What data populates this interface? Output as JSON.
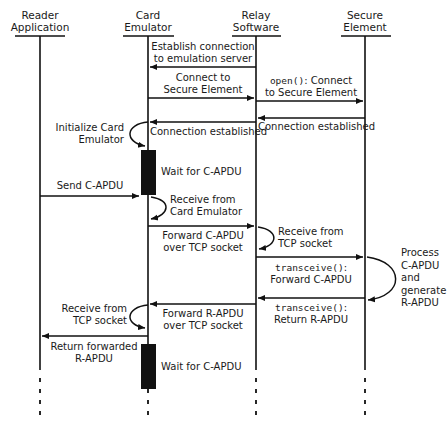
{
  "diagram": {
    "type": "sequence",
    "participants": [
      {
        "id": "reader",
        "line1": "Reader",
        "line2": "Application"
      },
      {
        "id": "card",
        "line1": "Card",
        "line2": "Emulator"
      },
      {
        "id": "relay",
        "line1": "Relay",
        "line2": "Software"
      },
      {
        "id": "secure",
        "line1": "Secure",
        "line2": "Element"
      }
    ],
    "messages": [
      {
        "from": "relay",
        "to": "card",
        "line1": "Establish connection",
        "line2": "to emulation server"
      },
      {
        "from": "card",
        "to": "relay",
        "line1": "Connect to",
        "line2": "Secure Element"
      },
      {
        "from": "relay",
        "to": "secure",
        "code": "open()",
        "line1": ": Connect",
        "line2": "to Secure Element"
      },
      {
        "from": "secure",
        "to": "relay",
        "line1": "Connection established"
      },
      {
        "from": "relay",
        "to": "card",
        "line1": "Connection established"
      },
      {
        "self": "card",
        "line1": "Initialize Card",
        "line2": "Emulator"
      },
      {
        "activation": "card",
        "line1": "Wait for C-APDU"
      },
      {
        "from": "reader",
        "to": "card",
        "line1": "Send C-APDU"
      },
      {
        "self": "card",
        "line1": "Receive from",
        "line2": "Card Emulator"
      },
      {
        "from": "card",
        "to": "relay",
        "line1": "Forward C-APDU",
        "line2": "over TCP socket"
      },
      {
        "self": "relay",
        "line1": "Receive from",
        "line2": "TCP socket"
      },
      {
        "from": "relay",
        "to": "secure",
        "code": "transceive()",
        "line1": ":",
        "line2": "Forward C-APDU"
      },
      {
        "self": "secure",
        "line1": "Process",
        "line2": "C-APDU",
        "line3": "and",
        "line4": "generate",
        "line5": "R-APDU"
      },
      {
        "from": "secure",
        "to": "relay",
        "code": "transceive()",
        "line1": ":",
        "line2": "Return R-APDU"
      },
      {
        "from": "relay",
        "to": "card",
        "line1": "Forward R-APDU",
        "line2": "over TCP socket"
      },
      {
        "self": "card",
        "line1": "Receive from",
        "line2": "TCP socket"
      },
      {
        "from": "card",
        "to": "reader",
        "line1": "Return forwarded",
        "line2": "R-APDU"
      },
      {
        "activation": "card",
        "line1": "Wait for C-APDU"
      }
    ]
  }
}
